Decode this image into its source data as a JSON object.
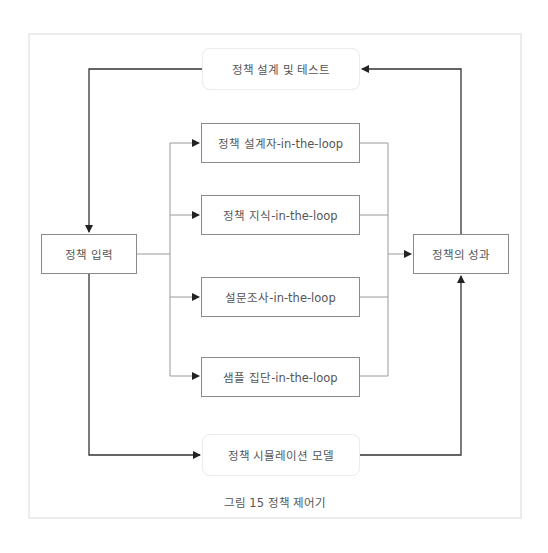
{
  "diagram": {
    "title": "정책 제어기",
    "caption": "그림 15 정책 제어기",
    "nodes": {
      "design_test": {
        "label": "정책 설계 및 테스트",
        "style": "rounded"
      },
      "input": {
        "label": "정책 입력",
        "style": "square"
      },
      "designer_loop": {
        "label": "정책 설계자-in-the-loop",
        "style": "square"
      },
      "knowledge_loop": {
        "label": "정책 지식-in-the-loop",
        "style": "square"
      },
      "survey_loop": {
        "label": "설문조사-in-the-loop",
        "style": "square"
      },
      "sample_loop": {
        "label": "샘플 집단-in-the-loop",
        "style": "square"
      },
      "outcome": {
        "label": "정책의 성과",
        "style": "square"
      },
      "simulation": {
        "label": "정책 시뮬레이션 모델",
        "style": "rounded"
      }
    },
    "edges": [
      {
        "from": "design_test",
        "to": "input"
      },
      {
        "from": "input",
        "to": "designer_loop"
      },
      {
        "from": "input",
        "to": "knowledge_loop"
      },
      {
        "from": "input",
        "to": "survey_loop"
      },
      {
        "from": "input",
        "to": "sample_loop"
      },
      {
        "from": "designer_loop",
        "to": "outcome"
      },
      {
        "from": "knowledge_loop",
        "to": "outcome"
      },
      {
        "from": "survey_loop",
        "to": "outcome"
      },
      {
        "from": "sample_loop",
        "to": "outcome"
      },
      {
        "from": "outcome",
        "to": "design_test"
      },
      {
        "from": "input",
        "to": "simulation"
      },
      {
        "from": "simulation",
        "to": "outcome"
      }
    ],
    "colors": {
      "line_dark": "#333333",
      "line_light": "#9a9a9a",
      "text": "#555555",
      "frame": "#ececec"
    }
  }
}
